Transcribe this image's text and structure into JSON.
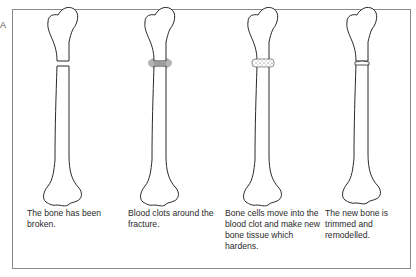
{
  "figure": {
    "panel_label": "A",
    "stages": [
      {
        "id": "broken",
        "caption": "The bone has been broken."
      },
      {
        "id": "clot",
        "caption": "Blood clots around the fracture."
      },
      {
        "id": "cells",
        "caption": "Bone cells move into the blood clot and make new bone tissue which hardens."
      },
      {
        "id": "remodel",
        "caption": "The new bone is trimmed and remodelled."
      }
    ],
    "colors": {
      "outline": "#2a2a2a",
      "frame": "#8a8a8a",
      "clot": "#9a9a9a"
    }
  }
}
